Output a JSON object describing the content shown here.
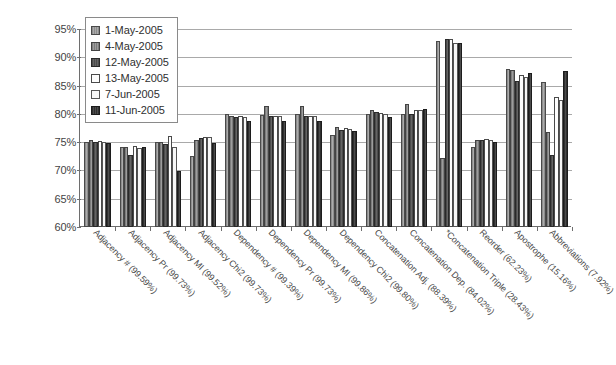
{
  "chart_data": {
    "type": "bar",
    "title": "",
    "xlabel": "",
    "ylabel": "",
    "ylim": [
      60,
      95
    ],
    "ytick_labels": [
      "95%",
      "90%",
      "85%",
      "80%",
      "75%",
      "70%",
      "65%",
      "60%"
    ],
    "ytick_values": [
      95,
      90,
      85,
      80,
      75,
      70,
      65,
      60
    ],
    "grid": true,
    "legend_position": "top-left",
    "categories": [
      "Adjacency # (99.59%)",
      "Adjacency Pr (99.73%)",
      "Adjacency MI (99.52%)",
      "Adjacency Chi2 (99.73%)",
      "Dependency # (99.39%)",
      "Dependency Pr (99.73%)",
      "Dependency MI (99.86%)",
      "Dependency Chi2 (99.80%)",
      "Concatenation Adj. (88.39%)",
      "Concatenation Dep. (84.02%)",
      "*Concatenation Triple (28.43%)",
      "Reorder (62.23%)",
      "Apostrophe (15.16%)",
      "Abbreviations (7.92%)"
    ],
    "series": [
      {
        "name": "1-May-2005",
        "values": [
          75.0,
          74.2,
          75.0,
          72.6,
          79.9,
          79.8,
          79.9,
          76.2,
          79.9,
          79.9,
          92.9,
          74.2,
          88.0,
          85.7
        ]
      },
      {
        "name": "4-May-2005",
        "values": [
          75.3,
          74.2,
          75.0,
          75.4,
          79.6,
          81.4,
          81.4,
          77.6,
          80.6,
          81.8,
          72.2,
          75.4,
          87.7,
          76.8
        ]
      },
      {
        "name": "12-May-2005",
        "values": [
          75.1,
          72.8,
          74.6,
          75.8,
          79.5,
          79.7,
          79.7,
          77.1,
          80.3,
          80.0,
          93.2,
          75.4,
          85.8,
          72.8
        ]
      },
      {
        "name": "13-May-2005",
        "values": [
          75.2,
          74.3,
          76.1,
          76.0,
          79.6,
          79.7,
          79.6,
          77.5,
          80.1,
          80.6,
          93.3,
          75.6,
          86.8,
          83.0
        ]
      },
      {
        "name": "7-Jun-2005",
        "values": [
          75.1,
          74.0,
          74.2,
          75.9,
          79.5,
          79.6,
          79.6,
          77.3,
          79.9,
          80.7,
          92.6,
          75.3,
          86.6,
          82.5
        ]
      },
      {
        "name": "11-Jun-2005",
        "values": [
          74.9,
          74.1,
          69.9,
          74.9,
          78.8,
          78.7,
          78.8,
          76.9,
          79.5,
          80.8,
          92.6,
          75.0,
          87.3,
          87.6
        ]
      }
    ]
  },
  "legend": {
    "items": [
      {
        "label": "1-May-2005",
        "swatch": "series-swatch-0"
      },
      {
        "label": "4-May-2005",
        "swatch": "series-swatch-1"
      },
      {
        "label": "12-May-2005",
        "swatch": "series-swatch-2"
      },
      {
        "label": "13-May-2005",
        "swatch": "series-swatch-3"
      },
      {
        "label": "7-Jun-2005",
        "swatch": "series-swatch-4"
      },
      {
        "label": "11-Jun-2005",
        "swatch": "series-swatch-5"
      }
    ]
  },
  "colors": {
    "series_0": "#9a9a9a",
    "series_1": "#8c8c8c",
    "series_2": "#595959",
    "series_3": "#fdfdfd",
    "series_4": "#f7f7f7",
    "series_5": "#3c3c3c",
    "axis": "#6e6e6e",
    "gridline": "#a9a9a9",
    "text": "#3a3a3a",
    "background": "#ffffff"
  }
}
